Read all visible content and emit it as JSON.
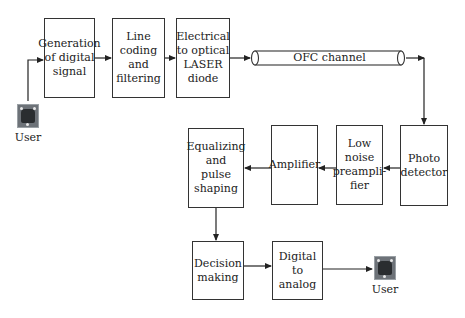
{
  "diagram": {
    "type": "block-diagram",
    "transmitter": {
      "source_user": "User",
      "blocks": [
        {
          "id": "gen",
          "label": "Generation\nof digital\nsignal"
        },
        {
          "id": "line",
          "label": "Line coding\nand\nfiltering"
        },
        {
          "id": "e2o",
          "label": "Electrical\nto optical\nLASER\ndiode"
        }
      ]
    },
    "channel": {
      "id": "ofc",
      "label": "OFC channel"
    },
    "receiver": {
      "blocks": [
        {
          "id": "photo",
          "label": "Photo\ndetector"
        },
        {
          "id": "lna",
          "label": "Low noise\npreampli-\nfier"
        },
        {
          "id": "amp",
          "label": "Amplifier"
        },
        {
          "id": "eq",
          "label": "Equalizing\nand\npulse\nshaping"
        },
        {
          "id": "dec",
          "label": "Decision\nmaking"
        },
        {
          "id": "d2a",
          "label": "Digital to\nanalog"
        }
      ],
      "sink_user": "User"
    },
    "edges": [
      [
        "User",
        "gen"
      ],
      [
        "gen",
        "line"
      ],
      [
        "line",
        "e2o"
      ],
      [
        "e2o",
        "ofc"
      ],
      [
        "ofc",
        "photo"
      ],
      [
        "photo",
        "lna"
      ],
      [
        "lna",
        "amp"
      ],
      [
        "amp",
        "eq"
      ],
      [
        "eq",
        "dec"
      ],
      [
        "dec",
        "d2a"
      ],
      [
        "d2a",
        "User"
      ]
    ]
  }
}
